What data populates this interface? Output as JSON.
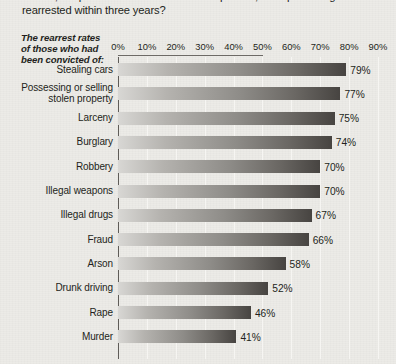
{
  "question": {
    "lines": [
      "Of 272,000 prisoners released from U.S. prisons, what percentage were",
      "rearrested within three years?"
    ]
  },
  "axis_caption": {
    "lines": [
      "The rearrest rates",
      "of those who had",
      "been convicted of:"
    ]
  },
  "chart_data": {
    "type": "bar",
    "orientation": "horizontal",
    "title": "Of 272,000 prisoners released from U.S. prisons, what percentage were rearrested within three years?",
    "xlabel": "",
    "ylabel": "The rearrest rates of those who had been convicted of:",
    "xlim": [
      0,
      90
    ],
    "grid": true,
    "legend": null,
    "tick_labels": [
      "0%",
      "10%",
      "20%",
      "30%",
      "40%",
      "50%",
      "60%",
      "70%",
      "80%",
      "90%"
    ],
    "tick_values": [
      0,
      10,
      20,
      30,
      40,
      50,
      60,
      70,
      80,
      90
    ],
    "categories": [
      "Stealing cars",
      "Possessing or selling stolen property",
      "Larceny",
      "Burglary",
      "Robbery",
      "Illegal weapons",
      "Illegal drugs",
      "Fraud",
      "Arson",
      "Drunk driving",
      "Rape",
      "Murder"
    ],
    "values": [
      79,
      77,
      75,
      74,
      70,
      70,
      67,
      66,
      58,
      52,
      46,
      41
    ],
    "value_labels": [
      "79%",
      "77%",
      "75%",
      "74%",
      "70%",
      "70%",
      "67%",
      "66%",
      "58%",
      "52%",
      "46%",
      "41%"
    ],
    "bars": [
      {
        "label_lines": [
          "Stealing cars"
        ],
        "value": 79,
        "value_label": "79%"
      },
      {
        "label_lines": [
          "Possessing or selling",
          "stolen property"
        ],
        "value": 77,
        "value_label": "77%"
      },
      {
        "label_lines": [
          "Larceny"
        ],
        "value": 75,
        "value_label": "75%"
      },
      {
        "label_lines": [
          "Burglary"
        ],
        "value": 74,
        "value_label": "74%"
      },
      {
        "label_lines": [
          "Robbery"
        ],
        "value": 70,
        "value_label": "70%"
      },
      {
        "label_lines": [
          "Illegal weapons"
        ],
        "value": 70,
        "value_label": "70%"
      },
      {
        "label_lines": [
          "Illegal drugs"
        ],
        "value": 67,
        "value_label": "67%"
      },
      {
        "label_lines": [
          "Fraud"
        ],
        "value": 66,
        "value_label": "66%"
      },
      {
        "label_lines": [
          "Arson"
        ],
        "value": 58,
        "value_label": "58%"
      },
      {
        "label_lines": [
          "Drunk driving"
        ],
        "value": 52,
        "value_label": "52%"
      },
      {
        "label_lines": [
          "Rape"
        ],
        "value": 46,
        "value_label": "46%"
      },
      {
        "label_lines": [
          "Murder"
        ],
        "value": 41,
        "value_label": "41%"
      }
    ]
  },
  "colors": {
    "background": "#ecebe7",
    "text": "#231f20",
    "gridline": "#f6f5f2",
    "axis_line": "#5f5c58",
    "bar_light": "#d8d7d4",
    "bar_dark": "#474441"
  }
}
